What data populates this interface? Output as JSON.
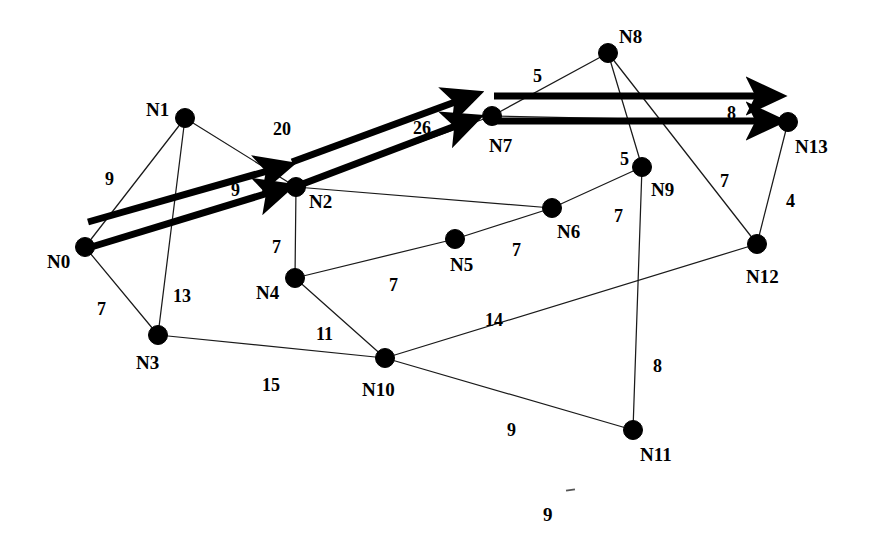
{
  "figure": {
    "page_number": "9",
    "background_color": "#ffffff",
    "ink_color": "#000000",
    "highlight_color": "#000000"
  },
  "nodes": [
    {
      "id": "N0",
      "label": "N0",
      "x": 85,
      "y": 247,
      "label_x": 47,
      "label_y": 252
    },
    {
      "id": "N1",
      "label": "N1",
      "x": 185,
      "y": 118,
      "label_x": 146,
      "label_y": 100
    },
    {
      "id": "N2",
      "label": "N2",
      "x": 296,
      "y": 187,
      "label_x": 309,
      "label_y": 192
    },
    {
      "id": "N3",
      "label": "N3",
      "x": 158,
      "y": 335,
      "label_x": 136,
      "label_y": 353
    },
    {
      "id": "N4",
      "label": "N4",
      "x": 295,
      "y": 278,
      "label_x": 256,
      "label_y": 283
    },
    {
      "id": "N5",
      "label": "N5",
      "x": 455,
      "y": 239,
      "label_x": 450,
      "label_y": 255
    },
    {
      "id": "N6",
      "label": "N6",
      "x": 552,
      "y": 208,
      "label_x": 557,
      "label_y": 222
    },
    {
      "id": "N7",
      "label": "N7",
      "x": 492,
      "y": 116,
      "label_x": 489,
      "label_y": 136
    },
    {
      "id": "N8",
      "label": "N8",
      "x": 608,
      "y": 53,
      "label_x": 619,
      "label_y": 27
    },
    {
      "id": "N9",
      "label": "N9",
      "x": 642,
      "y": 167,
      "label_x": 651,
      "label_y": 180
    },
    {
      "id": "N10",
      "label": "N10",
      "x": 385,
      "y": 358,
      "label_x": 362,
      "label_y": 380
    },
    {
      "id": "N11",
      "label": "N11",
      "x": 633,
      "y": 430,
      "label_x": 640,
      "label_y": 445
    },
    {
      "id": "N12",
      "label": "N12",
      "x": 757,
      "y": 244,
      "label_x": 746,
      "label_y": 267
    },
    {
      "id": "N13",
      "label": "N13",
      "x": 788,
      "y": 122,
      "label_x": 795,
      "label_y": 137
    }
  ],
  "edges": [
    {
      "from": "N0",
      "to": "N1",
      "weight": "9",
      "label_x": 105,
      "label_y": 170
    },
    {
      "from": "N0",
      "to": "N2",
      "weight": "9",
      "label_x": 231,
      "label_y": 181
    },
    {
      "from": "N0",
      "to": "N3",
      "weight": "7",
      "label_x": 97,
      "label_y": 300
    },
    {
      "from": "N1",
      "to": "N2",
      "weight": "20",
      "label_x": 273,
      "label_y": 120
    },
    {
      "from": "N1",
      "to": "N3",
      "weight": "13",
      "label_x": 173,
      "label_y": 287
    },
    {
      "from": "N2",
      "to": "N7",
      "weight": "26",
      "label_x": 413,
      "label_y": 119
    },
    {
      "from": "N2",
      "to": "N4",
      "weight": "7",
      "label_x": 272,
      "label_y": 238
    },
    {
      "from": "N3",
      "to": "N10",
      "weight": "15",
      "label_x": 262,
      "label_y": 376
    },
    {
      "from": "N4",
      "to": "N5",
      "weight": "7",
      "label_x": 389,
      "label_y": 276
    },
    {
      "from": "N4",
      "to": "N10",
      "weight": "11",
      "label_x": 316,
      "label_y": 325
    },
    {
      "from": "N5",
      "to": "N6",
      "weight": "7",
      "label_x": 512,
      "label_y": 241
    },
    {
      "from": "N6",
      "to": "N9",
      "weight": "7",
      "label_x": 614,
      "label_y": 207
    },
    {
      "from": "N7",
      "to": "N8",
      "weight": "5",
      "label_x": 533,
      "label_y": 67
    },
    {
      "from": "N7",
      "to": "N13",
      "weight": "8",
      "label_x": 727,
      "label_y": 104
    },
    {
      "from": "N8",
      "to": "N9",
      "weight": "5",
      "label_x": 620,
      "label_y": 150
    },
    {
      "from": "N8",
      "to": "N12",
      "weight": "7",
      "label_x": 720,
      "label_y": 172
    },
    {
      "from": "N9",
      "to": "N11",
      "weight": "8",
      "label_x": 653,
      "label_y": 357
    },
    {
      "from": "N10",
      "to": "N11",
      "weight": "9",
      "label_x": 507,
      "label_y": 421
    },
    {
      "from": "N10",
      "to": "N12",
      "weight": "14",
      "label_x": 485,
      "label_y": 311
    },
    {
      "from": "N12",
      "to": "N13",
      "weight": "4",
      "label_x": 786,
      "label_y": 192
    }
  ],
  "highlight_paths": [
    {
      "name": "path-upper",
      "from": "N0",
      "to": "N2",
      "style": "thick-arrow"
    },
    {
      "name": "path-lower",
      "from": "N0",
      "to": "N2",
      "style": "thick-arrow"
    },
    {
      "name": "path-mid-upper",
      "from": "N2",
      "to": "N7",
      "style": "thick-arrow"
    },
    {
      "name": "path-mid-lower",
      "from": "N2",
      "to": "N7",
      "style": "thick-arrow"
    },
    {
      "name": "path-right-upper",
      "from": "N7",
      "to": "N13",
      "style": "thick-arrow"
    },
    {
      "name": "path-right-lower",
      "from": "N7",
      "to": "N13",
      "style": "thick-arrow"
    }
  ]
}
